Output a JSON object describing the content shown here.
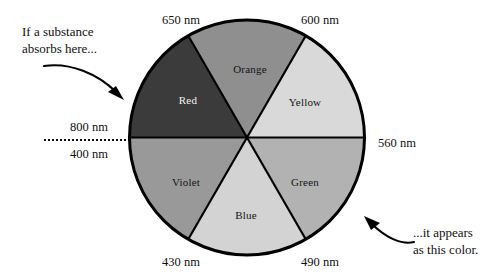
{
  "diagram": {
    "type": "color-wheel"
  },
  "chart_data": {
    "type": "pie",
    "categories": [
      "Orange",
      "Yellow",
      "Green",
      "Blue",
      "Violet",
      "Red"
    ],
    "values": [
      60,
      60,
      60,
      60,
      60,
      60
    ],
    "unit": "degrees",
    "legend": "none",
    "grid": false,
    "boundary_labels": [
      "650 nm",
      "600 nm",
      "560 nm",
      "490 nm",
      "430 nm",
      "400 nm",
      "800 nm"
    ]
  },
  "wheel": {
    "segments": [
      {
        "name": "Red",
        "label": "Red",
        "fill": "#3b3b3b",
        "label_color": "light",
        "label_x": 60,
        "label_y": 88
      },
      {
        "name": "Orange",
        "label": "Orange",
        "fill": "#8f8f8f",
        "label_color": "dark",
        "label_x": 122,
        "label_y": 57
      },
      {
        "name": "Yellow",
        "label": "Yellow",
        "fill": "#d9d9d9",
        "label_color": "dark",
        "label_x": 177,
        "label_y": 90
      },
      {
        "name": "Green",
        "label": "Green",
        "fill": "#b2b2b2",
        "label_color": "dark",
        "label_x": 177,
        "label_y": 170
      },
      {
        "name": "Blue",
        "label": "Blue",
        "fill": "#d3d3d3",
        "label_color": "dark",
        "label_x": 118,
        "label_y": 203
      },
      {
        "name": "Violet",
        "label": "Violet",
        "fill": "#999999",
        "label_color": "dark",
        "label_x": 58,
        "label_y": 170
      }
    ],
    "outline_color": "#000000"
  },
  "wavelengths": [
    {
      "id": "wl-650",
      "text": "650 nm",
      "x": 181,
      "y": 20
    },
    {
      "id": "wl-600",
      "text": "600 nm",
      "x": 320,
      "y": 20
    },
    {
      "id": "wl-560",
      "text": "560 nm",
      "x": 397,
      "y": 143
    },
    {
      "id": "wl-490",
      "text": "490 nm",
      "x": 320,
      "y": 262
    },
    {
      "id": "wl-430",
      "text": "430 nm",
      "x": 181,
      "y": 262
    },
    {
      "id": "wl-800",
      "text": "800 nm",
      "x": 89,
      "y": 127
    },
    {
      "id": "wl-400",
      "text": "400 nm",
      "x": 89,
      "y": 154
    }
  ],
  "annotations": {
    "left": {
      "line1": "If a substance",
      "line2": "absorbs here...",
      "x": 22,
      "y": 24
    },
    "right": {
      "line1": "...it appears",
      "line2": "as this color.",
      "x": 413,
      "y": 225
    }
  }
}
